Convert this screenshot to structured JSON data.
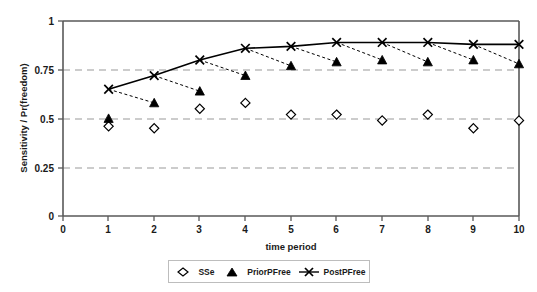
{
  "chart_data": {
    "type": "line",
    "title": "",
    "xlabel": "time period",
    "ylabel": "Sensitivity / Pr(freedom)",
    "x": [
      1,
      2,
      3,
      4,
      5,
      6,
      7,
      8,
      9,
      10
    ],
    "xlim": [
      0,
      10
    ],
    "ylim": [
      0,
      1
    ],
    "xticks": [
      "0",
      "1",
      "2",
      "3",
      "4",
      "5",
      "6",
      "7",
      "8",
      "9",
      "10"
    ],
    "yticks": [
      "0",
      "0.25",
      "0.5",
      "0.75",
      "1"
    ],
    "grid": "horizontal-dashed",
    "legend_position": "bottom-center",
    "series": [
      {
        "name": "SSe",
        "marker": "open-diamond",
        "line": "none",
        "values": [
          0.46,
          0.45,
          0.55,
          0.58,
          0.52,
          0.52,
          0.49,
          0.52,
          0.45,
          0.49
        ]
      },
      {
        "name": "PriorPFree",
        "marker": "filled-triangle",
        "line": "dashed",
        "values": [
          0.5,
          0.58,
          0.64,
          0.72,
          0.77,
          0.79,
          0.8,
          0.79,
          0.8,
          0.78
        ]
      },
      {
        "name": "PostPFree",
        "marker": "cross-x",
        "line": "solid",
        "values": [
          0.65,
          0.72,
          0.8,
          0.86,
          0.87,
          0.89,
          0.89,
          0.89,
          0.88,
          0.88
        ]
      }
    ],
    "connector_note": "Each PostPFree point at period t connects by a dashed line to the PriorPFree point at period t+1"
  },
  "legend": {
    "items": [
      {
        "label": "SSe",
        "icon": "open-diamond-icon"
      },
      {
        "label": "PriorPFree",
        "icon": "filled-triangle-icon"
      },
      {
        "label": "PostPFree",
        "icon": "cross-x-line-icon"
      }
    ]
  },
  "colors": {
    "axis": "#595959",
    "grid": "#9a9a9a",
    "series": "#000000",
    "background": "#ffffff"
  }
}
